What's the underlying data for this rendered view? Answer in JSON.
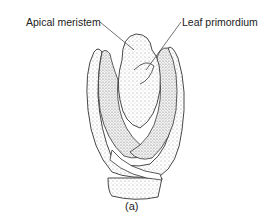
{
  "figure": {
    "caption": "(a)",
    "labels": [
      {
        "text": "Apical meristem",
        "pointer_target": "dome of shoot apex"
      },
      {
        "text": "Leaf primordium",
        "pointer_target": "young leaf at apex"
      }
    ]
  },
  "colors": {
    "line": "#333333",
    "stipple": "#9a9a9a",
    "background": "#ffffff"
  }
}
